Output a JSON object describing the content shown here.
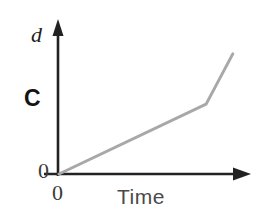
{
  "figure": {
    "background_color": "#ffffff",
    "width": 266,
    "height": 219
  },
  "labels": {
    "y_axis": "d",
    "x_axis": "Time",
    "origin_y": "0",
    "origin_x": "0",
    "panel": "C"
  },
  "style": {
    "axis_color": "#222222",
    "line_color": "#a8a8a8",
    "text_color": "#2b2b2b"
  },
  "chart_data": {
    "type": "line",
    "title": "",
    "xlabel": "Time",
    "ylabel": "d",
    "grid": false,
    "legend": false,
    "axis_origin_label": "0",
    "panel_label": "C",
    "xlim": [
      0,
      1
    ],
    "ylim": [
      0,
      1
    ],
    "series": [
      {
        "name": "distance",
        "color": "#a8a8a8",
        "x": [
          0.0,
          0.77,
          0.91
        ],
        "y": [
          0.0,
          0.46,
          0.79
        ],
        "description": "Distance rises linearly from the origin, then kinks upward to a steeper slope near the end."
      }
    ],
    "annotations": []
  }
}
